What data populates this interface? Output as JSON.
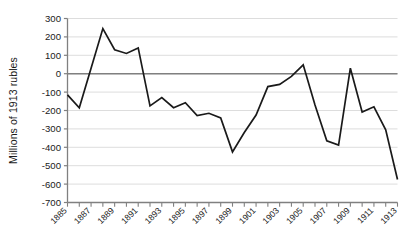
{
  "chart_data": {
    "type": "line",
    "title": "",
    "xlabel": "",
    "ylabel": "Millions of 1913 rubles",
    "ylim": [
      -700,
      300
    ],
    "xlim": [
      1885,
      1913
    ],
    "grid": true,
    "legend": false,
    "legend_position": "none",
    "line_color": "#1a1a1a",
    "grid_color": "#d9d9d9",
    "zero_line_color": "#808080",
    "axis_color": "#808080",
    "ytick_labels": [
      "300",
      "200",
      "100",
      "0",
      "-100",
      "-200",
      "-300",
      "-400",
      "-500",
      "-600",
      "-700"
    ],
    "ytick_values": [
      300,
      200,
      100,
      0,
      -100,
      -200,
      -300,
      -400,
      -500,
      -600,
      -700
    ],
    "xtick_labels": [
      "1885",
      "1887",
      "1889",
      "1891",
      "1893",
      "1895",
      "1897",
      "1899",
      "1901",
      "1903",
      "1905",
      "1907",
      "1909",
      "1911",
      "1913"
    ],
    "xtick_values": [
      1885,
      1887,
      1889,
      1891,
      1893,
      1895,
      1897,
      1899,
      1901,
      1903,
      1905,
      1907,
      1909,
      1911,
      1913
    ],
    "minor_xticks": [
      1885,
      1886,
      1887,
      1888,
      1889,
      1890,
      1891,
      1892,
      1893,
      1894,
      1895,
      1896,
      1897,
      1898,
      1899,
      1900,
      1901,
      1902,
      1903,
      1904,
      1905,
      1906,
      1907,
      1908,
      1909,
      1910,
      1911,
      1912,
      1913
    ],
    "x": [
      1885,
      1886,
      1887,
      1888,
      1889,
      1890,
      1891,
      1892,
      1893,
      1894,
      1895,
      1896,
      1897,
      1898,
      1899,
      1900,
      1901,
      1902,
      1903,
      1904,
      1905,
      1906,
      1907,
      1908,
      1909,
      1910,
      1911,
      1912,
      1913
    ],
    "values": [
      -115,
      -185,
      30,
      245,
      130,
      110,
      140,
      -175,
      -130,
      -185,
      -158,
      -228,
      -215,
      -240,
      -425,
      -320,
      -225,
      -70,
      -58,
      -15,
      48,
      -170,
      -365,
      -388,
      30,
      -208,
      -180,
      -305,
      -575
    ],
    "series": [
      {
        "name": "Net balance",
        "values": [
          -115,
          -185,
          30,
          245,
          130,
          110,
          140,
          -175,
          -130,
          -185,
          -158,
          -228,
          -215,
          -240,
          -425,
          -320,
          -225,
          -70,
          -58,
          -15,
          48,
          -170,
          -365,
          -388,
          30,
          -208,
          -180,
          -305,
          -575
        ]
      }
    ]
  }
}
